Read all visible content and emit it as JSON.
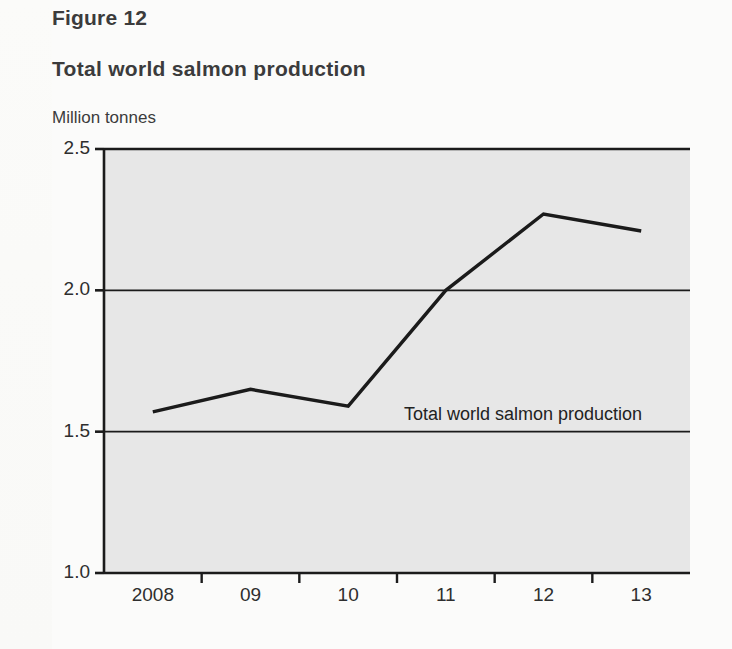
{
  "figure": {
    "label": "Figure 12",
    "title": "Total world salmon production"
  },
  "colors": {
    "page_background": "#fbfbfa",
    "plot_background": "#e7e7e7",
    "axis": "#1b1b1b",
    "gridline": "#1b1b1b",
    "series_line": "#1b1b1b",
    "text": "#3b3b3c"
  },
  "chart_data": {
    "type": "line",
    "title": "Total world salmon production",
    "xlabel": "",
    "ylabel": "Million tonnes",
    "ylim": [
      1.0,
      2.5
    ],
    "yticks": [
      "1.0",
      "1.5",
      "2.0",
      "2.5"
    ],
    "ytick_values": [
      1.0,
      1.5,
      2.0,
      2.5
    ],
    "grid": true,
    "grid_axis": "y",
    "legend_position": "inline-annotation",
    "annotations": [
      {
        "text": "Total world salmon production",
        "x": "2010.5",
        "y": "1.55"
      }
    ],
    "categories": [
      "2008",
      "09",
      "10",
      "11",
      "12",
      "13"
    ],
    "x": [
      2008,
      2009,
      2010,
      2011,
      2012,
      2013
    ],
    "xtick_labels": [
      "2008",
      "09",
      "10",
      "11",
      "12",
      "13"
    ],
    "series": [
      {
        "name": "Total world salmon production",
        "values": [
          1.57,
          1.65,
          1.59,
          2.0,
          2.27,
          2.21
        ]
      }
    ]
  }
}
